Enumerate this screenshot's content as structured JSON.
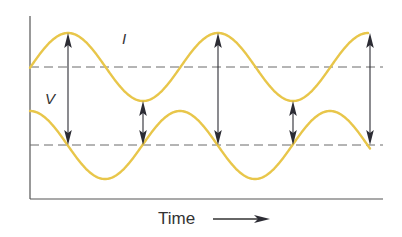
{
  "diagram": {
    "labels": {
      "current": "I",
      "voltage": "V",
      "time_axis": "Time"
    },
    "colors": {
      "wave": "#e8c64a",
      "axis": "#555555",
      "baseline": "#6b6b6b",
      "arrow": "#2c2c34",
      "text": "#333333"
    },
    "axes": {
      "origin_x": 30,
      "top_y": 16,
      "bottom_y": 199,
      "right_x": 383
    },
    "current_wave": {
      "name": "I",
      "baseline_y": 67,
      "amplitude": 34,
      "period": 150,
      "first_peak_x": 68,
      "x_start": 30,
      "x_end": 368
    },
    "voltage_wave": {
      "name": "V",
      "baseline_y": 145,
      "amplitude": 34,
      "period": 150,
      "first_peak_x": 180,
      "x_start": 30,
      "x_end": 370
    },
    "arrows_x": [
      68,
      143,
      218,
      293,
      370
    ],
    "time_arrow": {
      "label_x": 158,
      "label_y": 224,
      "line_x1": 213,
      "line_x2": 270,
      "y": 219
    },
    "label_positions": {
      "current": [
        122,
        44
      ],
      "voltage": [
        45,
        104
      ]
    }
  }
}
